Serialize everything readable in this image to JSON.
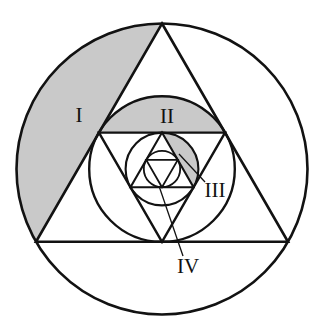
{
  "figure": {
    "background_color": "#ffffff",
    "stroke_color": "#121212",
    "shade_color": "#c9c9c9",
    "canvas": {
      "width": 328,
      "height": 336
    }
  },
  "labels": [
    {
      "id": "I",
      "text": "I",
      "x": 79,
      "y": 117,
      "font_size": 21
    },
    {
      "id": "II",
      "text": "II",
      "x": 167,
      "y": 118,
      "font_size": 21
    },
    {
      "id": "III",
      "text": "III",
      "x": 215,
      "y": 192,
      "font_size": 21
    },
    {
      "id": "IV",
      "text": "IV",
      "x": 188,
      "y": 268,
      "font_size": 21
    }
  ],
  "leaders": [
    {
      "id": "leader-iii",
      "x1": 205,
      "y1": 182,
      "x2": 179,
      "y2": 154
    },
    {
      "id": "leader-iv",
      "x1": 183,
      "y1": 256,
      "x2": 159,
      "y2": 186
    }
  ],
  "shapes": {
    "circle_1": {
      "cx": 162,
      "cy": 169,
      "r": 145.5,
      "stroke_width": 2.6
    },
    "triangle_1": {
      "cx": 162,
      "cy": 169,
      "r": 145.5,
      "rotation": -90,
      "stroke_width": 2.6
    },
    "circle_2": {
      "cx": 162,
      "cy": 169,
      "r": 72.8,
      "stroke_width": 2.4
    },
    "triangle_2": {
      "cx": 162,
      "cy": 169,
      "r": 72.8,
      "rotation": 90,
      "stroke_width": 2.4
    },
    "circle_3": {
      "cx": 162,
      "cy": 169,
      "r": 36.4,
      "stroke_width": 2.1
    },
    "triangle_3": {
      "cx": 162,
      "cy": 169,
      "r": 36.4,
      "rotation": -90,
      "stroke_width": 2.1
    },
    "circle_4": {
      "cx": 162,
      "cy": 169,
      "r": 18.2,
      "stroke_width": 1.8
    },
    "triangle_4": {
      "cx": 162,
      "cy": 169,
      "r": 18.2,
      "rotation": 90,
      "stroke_width": 1.8
    }
  },
  "shaded_regions": [
    {
      "id": "region-I",
      "description": "circular segment of circle 1 cut by upper-left side of triangle 1"
    },
    {
      "id": "region-II",
      "description": "circular segment of circle 2 cut by top side of triangle 2"
    },
    {
      "id": "region-III",
      "description": "circular segment of circle 3 cut by lower-right side of triangle 3"
    }
  ]
}
